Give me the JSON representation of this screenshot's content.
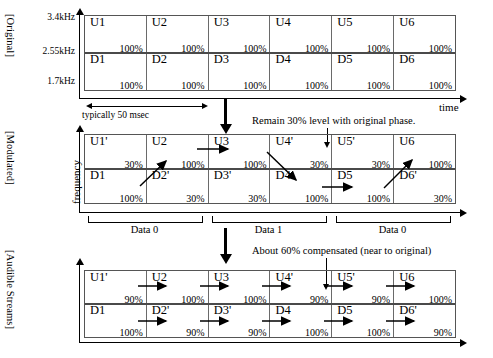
{
  "figure": {
    "side_labels": {
      "original": "[Original]",
      "modulated": "[Modulated]",
      "audible": "[Audible Streams]"
    },
    "axis": {
      "freq_ticks": [
        "3.4kHz",
        "2.55kHz",
        "1.7kHz"
      ],
      "freq_label": "frequency",
      "time_label": "time",
      "duration_label": "typically 50 msec"
    },
    "annotations": {
      "modulated_note": "Remain 30% level with original phase.",
      "audible_note": "About 60% compensated (near to original)"
    },
    "data_brackets": [
      {
        "label": "Data 0"
      },
      {
        "label": "Data 1"
      },
      {
        "label": "Data 0"
      }
    ]
  },
  "chart_data": {
    "type": "table",
    "xlabel": "time",
    "ylabel": "frequency",
    "ytick_labels": [
      "3.4kHz",
      "2.55kHz",
      "1.7kHz"
    ],
    "frame_duration": "typically 50 msec",
    "n_frames": 6,
    "panels": [
      {
        "name": "Original",
        "upper": [
          {
            "label": "U1",
            "percent": "100%"
          },
          {
            "label": "U2",
            "percent": "100%"
          },
          {
            "label": "U3",
            "percent": "100%"
          },
          {
            "label": "U4",
            "percent": "100%"
          },
          {
            "label": "U5",
            "percent": "100%"
          },
          {
            "label": "U6",
            "percent": "100%"
          }
        ],
        "lower": [
          {
            "label": "D1",
            "percent": "100%"
          },
          {
            "label": "D2",
            "percent": "100%"
          },
          {
            "label": "D3",
            "percent": "100%"
          },
          {
            "label": "D4",
            "percent": "100%"
          },
          {
            "label": "D5",
            "percent": "100%"
          },
          {
            "label": "D6",
            "percent": "100%"
          }
        ]
      },
      {
        "name": "Modulated",
        "upper": [
          {
            "label": "U1'",
            "percent": "30%"
          },
          {
            "label": "U2",
            "percent": "100%"
          },
          {
            "label": "U3",
            "percent": "100%"
          },
          {
            "label": "U4'",
            "percent": "30%"
          },
          {
            "label": "U5'",
            "percent": "30%"
          },
          {
            "label": "U6",
            "percent": "100%"
          }
        ],
        "lower": [
          {
            "label": "D1",
            "percent": "100%"
          },
          {
            "label": "D2'",
            "percent": "30%"
          },
          {
            "label": "D3'",
            "percent": "30%"
          },
          {
            "label": "D4",
            "percent": "100%"
          },
          {
            "label": "D5",
            "percent": "100%"
          },
          {
            "label": "D6'",
            "percent": "30%"
          }
        ]
      },
      {
        "name": "Audible Streams",
        "upper": [
          {
            "label": "U1'",
            "percent": "90%"
          },
          {
            "label": "U2",
            "percent": "100%"
          },
          {
            "label": "U3",
            "percent": "100%"
          },
          {
            "label": "U4'",
            "percent": "90%"
          },
          {
            "label": "U5'",
            "percent": "90%"
          },
          {
            "label": "U6",
            "percent": "100%"
          }
        ],
        "lower": [
          {
            "label": "D1",
            "percent": "100%"
          },
          {
            "label": "D2'",
            "percent": "90%"
          },
          {
            "label": "D3'",
            "percent": "90%"
          },
          {
            "label": "D4",
            "percent": "100%"
          },
          {
            "label": "D5",
            "percent": "100%"
          },
          {
            "label": "D6'",
            "percent": "90%"
          }
        ]
      }
    ]
  }
}
